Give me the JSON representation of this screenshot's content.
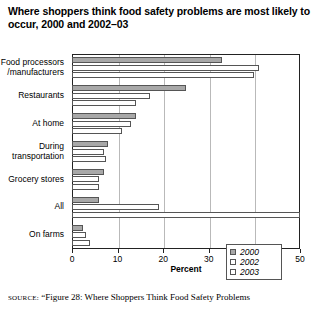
{
  "title": "Where shoppers think food safety problems are most likely to occur, 2000 and 2002–03",
  "source": {
    "label": "SOURCE:",
    "text": "“Figure 28: Where Shoppers Think Food Safety Problems"
  },
  "chart_data": {
    "type": "bar",
    "orientation": "horizontal",
    "title": "Where shoppers think food safety problems are most likely to occur, 2000 and 2002–03",
    "xlabel": "Percent",
    "ylabel": "",
    "xlim": [
      0,
      50
    ],
    "xticks": [
      0,
      10,
      20,
      30,
      40,
      50
    ],
    "xticklabels": [
      "0",
      "10",
      "20",
      "30",
      "40",
      "50"
    ],
    "grid": true,
    "legend_position": "lower right",
    "categories": [
      "Food processors\n/manufacturers",
      "Restaurants",
      "At home",
      "During\ntransportation",
      "Grocery stores",
      "All",
      "On farms"
    ],
    "series": [
      {
        "name": "2000",
        "color": "#a8a8a8",
        "values": [
          33,
          25,
          14,
          8,
          7,
          6,
          2.5
        ]
      },
      {
        "name": "2002",
        "color": "#ffffff",
        "values": [
          41,
          17,
          13,
          7,
          6,
          19,
          3
        ]
      },
      {
        "name": "2003",
        "color": "#ffffff",
        "values": [
          40,
          14,
          11,
          7.5,
          6,
          50,
          4
        ]
      }
    ]
  },
  "legend": {
    "items": [
      {
        "label": "2000",
        "swatch": "#a8a8a8"
      },
      {
        "label": "2002",
        "swatch": "#ffffff"
      },
      {
        "label": "2003",
        "swatch": "#ffffff"
      }
    ]
  }
}
